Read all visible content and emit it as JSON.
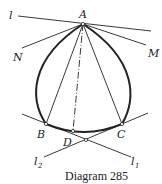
{
  "diagram": {
    "caption": "Diagram 285",
    "points": {
      "A": "A",
      "B": "B",
      "C": "C",
      "D": "D",
      "M": "M",
      "N": "N"
    },
    "lines": {
      "l": "l",
      "l1": "l",
      "l1_sub": "1",
      "l2": "l",
      "l2_sub": "2"
    },
    "colors": {
      "ink": "#222222",
      "background": "#ffffff"
    }
  }
}
